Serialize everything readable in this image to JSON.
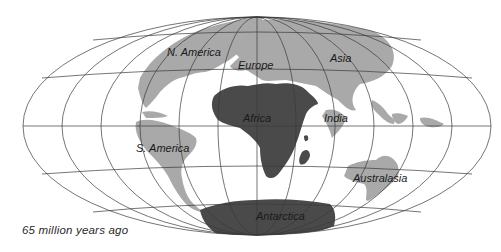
{
  "map": {
    "title": "Continental positions",
    "projection": "equal-area oval (Hammer-like)",
    "caption": "65 million years ago",
    "colors": {
      "background": "#ffffff",
      "ocean": "#ffffff",
      "grid": "#3a3a3a",
      "land_light": "#a9a9a9",
      "land_dark": "#4a4a4a",
      "text": "#1a1a1a"
    },
    "labels": {
      "north_america": "N. America",
      "europe": "Europe",
      "asia": "Asia",
      "africa": "Africa",
      "india": "India",
      "south_america": "S. America",
      "australasia": "Australasia",
      "antarctica": "Antarctica"
    }
  }
}
